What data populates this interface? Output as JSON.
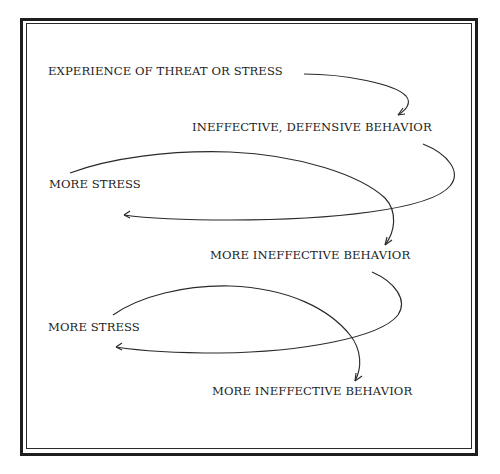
{
  "diagram": {
    "type": "cycle-flow",
    "nodes": [
      {
        "id": "n1",
        "label": "EXPERIENCE OF THREAT OR STRESS"
      },
      {
        "id": "n2",
        "label": "INEFFECTIVE, DEFENSIVE BEHAVIOR"
      },
      {
        "id": "n3",
        "label": "MORE STRESS"
      },
      {
        "id": "n4",
        "label": "MORE INEFFECTIVE BEHAVIOR"
      },
      {
        "id": "n5",
        "label": "MORE STRESS"
      },
      {
        "id": "n6",
        "label": "MORE INEFFECTIVE BEHAVIOR"
      }
    ],
    "edges": [
      {
        "from": "n1",
        "to": "n2"
      },
      {
        "from": "n2",
        "to": "n3"
      },
      {
        "from": "n3",
        "to": "n4"
      },
      {
        "from": "n4",
        "to": "n5"
      },
      {
        "from": "n5",
        "to": "n6"
      }
    ],
    "colors": {
      "stroke": "#2a2a2a",
      "text": "#222222",
      "background": "#ffffff"
    }
  }
}
